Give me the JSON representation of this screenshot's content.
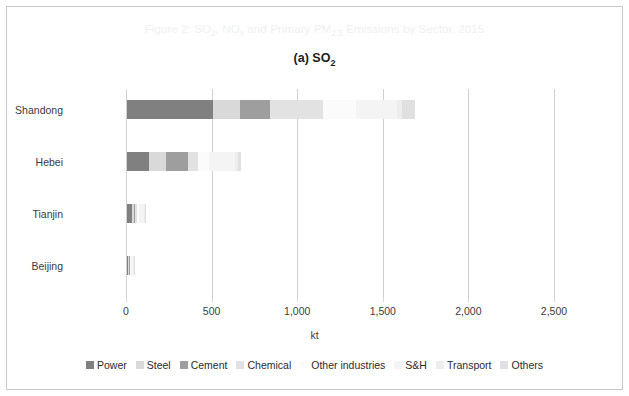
{
  "figure": {
    "title_parts": {
      "pre": "Figure 2: SO",
      "sub1": "2",
      "mid": ", NO",
      "sub2": "x",
      "mid2": " and Primary PM",
      "sub3": "2.5",
      "post": " Emissions by Sector, 2015"
    },
    "title_plain": "Figure 2: SO2, NOx and Primary PM2.5 Emissions by Sector, 2015",
    "subtitle_pre": "(a) SO",
    "subtitle_sub": "2",
    "subtitle_plain": "(a) SO2"
  },
  "colors": {
    "power": "#808080",
    "steel": "#d9d9d9",
    "cement": "#9e9e9e",
    "chemical": "#e2e2e2",
    "other_industries": "#fbfbfb",
    "sh": "#f4f4f4",
    "transport": "#ededed",
    "others": "#e0e0e0",
    "gridline": "#cfcfcf",
    "axis": "#d2d2d2",
    "title_gray": "#f0f0f0",
    "text": "#3a3a3a",
    "frame": "#c9c9c9"
  },
  "chart_data": {
    "type": "bar",
    "orientation": "horizontal",
    "stacked": true,
    "title": "Figure 2: SO2, NOx and Primary PM2.5 Emissions by Sector, 2015",
    "subtitle": "(a) SO2",
    "xlabel": "kt",
    "ylabel": "",
    "xlim": [
      0,
      2500
    ],
    "xticks": [
      0,
      500,
      1000,
      1500,
      2000,
      2500
    ],
    "xticklabels": [
      "0",
      "500",
      "1,000",
      "1,500",
      "2,000",
      "2,500"
    ],
    "grid": true,
    "legend_position": "bottom",
    "categories": [
      "Shandong",
      "Hebei",
      "Tianjin",
      "Beijing"
    ],
    "series": [
      {
        "name": "Power",
        "color": "#808080",
        "values": [
          500,
          130,
          30,
          8
        ]
      },
      {
        "name": "Steel",
        "color": "#d9d9d9",
        "values": [
          160,
          95,
          12,
          4
        ]
      },
      {
        "name": "Cement",
        "color": "#9e9e9e",
        "values": [
          175,
          130,
          6,
          3
        ]
      },
      {
        "name": "Chemical",
        "color": "#e2e2e2",
        "values": [
          310,
          60,
          10,
          4
        ]
      },
      {
        "name": "Other industries",
        "color": "#fbfbfb",
        "values": [
          190,
          65,
          10,
          6
        ]
      },
      {
        "name": "S&H",
        "color": "#f4f4f4",
        "values": [
          240,
          150,
          30,
          12
        ]
      },
      {
        "name": "Transport",
        "color": "#ededed",
        "values": [
          30,
          18,
          6,
          4
        ]
      },
      {
        "name": "Others",
        "color": "#e0e0e0",
        "values": [
          75,
          20,
          8,
          5
        ]
      }
    ],
    "totals": [
      1680,
      668,
      112,
      46
    ]
  },
  "legend": [
    {
      "label": "Power",
      "color": "#808080"
    },
    {
      "label": "Steel",
      "color": "#d9d9d9"
    },
    {
      "label": "Cement",
      "color": "#9e9e9e"
    },
    {
      "label": "Chemical",
      "color": "#e2e2e2"
    },
    {
      "label": "Other industries",
      "color": "#fbfbfb"
    },
    {
      "label": "S&H",
      "color": "#f4f4f4"
    },
    {
      "label": "Transport",
      "color": "#ededed"
    },
    {
      "label": "Others",
      "color": "#e0e0e0"
    }
  ]
}
